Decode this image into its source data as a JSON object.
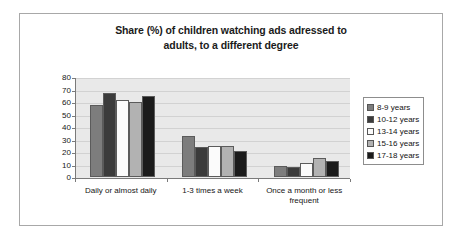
{
  "chart_data": {
    "type": "bar",
    "title": "Share (%) of children watching ads adressed to adults, to a different degree",
    "title_line_1": "Share (%) of children watching ads adressed to",
    "title_line_2": "adults, to a different degree",
    "xlabel": "",
    "ylabel": "",
    "ylim": [
      0,
      80
    ],
    "ytick_step": 10,
    "yticks": [
      0,
      10,
      20,
      30,
      40,
      50,
      60,
      70,
      80
    ],
    "ytick_labels": [
      "0",
      "10",
      "20",
      "30",
      "40",
      "50",
      "60",
      "70",
      "80"
    ],
    "grid": "horizontal",
    "legend_position": "right",
    "categories": [
      "Daily or almost daily",
      "1-3 times a week",
      "Once a month or less frequent"
    ],
    "series": [
      {
        "name": "8-9 years",
        "color": "#7d7d7d",
        "values": [
          58,
          33,
          9
        ]
      },
      {
        "name": "10-12 years",
        "color": "#3b3b3b",
        "values": [
          67,
          24,
          8
        ]
      },
      {
        "name": "13-14 years",
        "color": "#fbfbfb",
        "values": [
          62,
          25,
          11
        ]
      },
      {
        "name": "15-16 years",
        "color": "#b2b2b2",
        "values": [
          60,
          25,
          15
        ]
      },
      {
        "name": "17-18 years",
        "color": "#1b1b1b",
        "values": [
          65,
          21,
          13
        ]
      }
    ]
  }
}
